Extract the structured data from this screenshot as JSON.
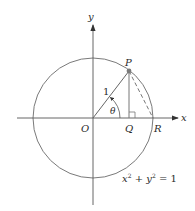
{
  "diagram": {
    "type": "unit-circle",
    "colors": {
      "stroke": "#6e6e6e",
      "axis": "#555555",
      "text": "#2a2a2a",
      "point": "#7a7a7a",
      "background": "#ffffff"
    },
    "labels": {
      "x_axis": "x",
      "y_axis": "y",
      "origin": "O",
      "point_p": "P",
      "point_q": "Q",
      "point_r": "R",
      "radius": "1",
      "angle": "θ",
      "equation_x": "x",
      "equation_x_exp": "2",
      "equation_plus": " + ",
      "equation_y": "y",
      "equation_y_exp": "2",
      "equation_rhs": " = 1"
    }
  }
}
